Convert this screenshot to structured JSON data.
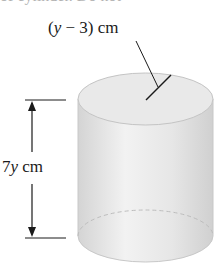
{
  "figure": {
    "type": "cylinder",
    "top_text_cut": "of cylinder. Do not",
    "radius_label": {
      "var": "y",
      "rest": " − 3) cm",
      "open": "("
    },
    "height_label": {
      "coef": "7",
      "var": "y",
      "unit": " cm"
    },
    "colors": {
      "line": "#1a1a1a",
      "fill_light": "#eeeeee",
      "fill_mid": "#d9d9d9",
      "outline": "#c8c8c8"
    }
  }
}
